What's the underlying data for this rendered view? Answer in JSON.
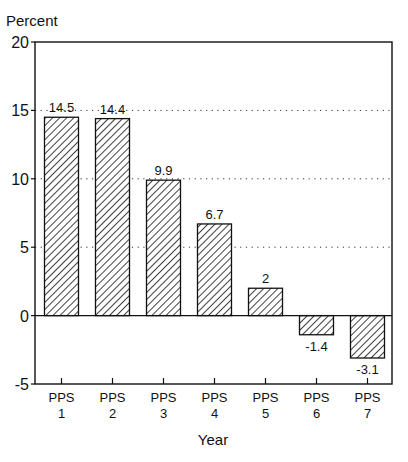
{
  "chart_data": {
    "type": "bar",
    "title": "",
    "ylabel": "Percent",
    "xlabel": "Year",
    "ylim": [
      -5,
      20
    ],
    "yticks": [
      -5,
      0,
      5,
      10,
      15,
      20
    ],
    "grid": "dotted horizontal at 5, 10, 15",
    "categories": [
      "PPS 1",
      "PPS 2",
      "PPS 3",
      "PPS 4",
      "PPS 5",
      "PPS 6",
      "PPS 7"
    ],
    "category_lines": [
      [
        "PPS",
        "1"
      ],
      [
        "PPS",
        "2"
      ],
      [
        "PPS",
        "3"
      ],
      [
        "PPS",
        "4"
      ],
      [
        "PPS",
        "5"
      ],
      [
        "PPS",
        "6"
      ],
      [
        "PPS",
        "7"
      ]
    ],
    "values": [
      14.5,
      14.4,
      9.9,
      6.7,
      2,
      -1.4,
      -3.1
    ],
    "labels": [
      "14.5",
      "14.4",
      "9.9",
      "6.7",
      "2",
      "-1.4",
      "-3.1"
    ],
    "bar_fill": "diagonal hatch",
    "colors": {
      "stroke": "#111111",
      "background": "#ffffff"
    }
  }
}
